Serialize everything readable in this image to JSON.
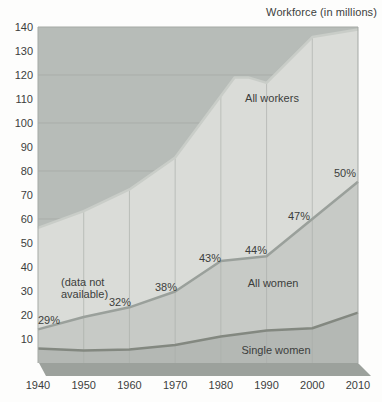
{
  "chart_data": {
    "type": "area",
    "title": "Workforce (in millions)",
    "xlabel": "",
    "ylabel": "",
    "xlim": [
      1940,
      2010
    ],
    "ylim": [
      0,
      140
    ],
    "yticks": [
      10,
      20,
      30,
      40,
      50,
      60,
      70,
      80,
      90,
      100,
      110,
      120,
      130,
      140
    ],
    "xticks": [
      1940,
      1950,
      1960,
      1970,
      1980,
      1990,
      2000,
      2010
    ],
    "ygrid_lines": [
      20,
      40,
      60,
      80,
      100,
      120
    ],
    "vgrid_years": [
      1950,
      1960,
      1970,
      1980,
      1990,
      2000
    ],
    "series": [
      {
        "name": "All workers",
        "points": [
          [
            1940,
            56.3
          ],
          [
            1950,
            63.3
          ],
          [
            1960,
            72.3
          ],
          [
            1970,
            85.6
          ],
          [
            1983,
            119
          ],
          [
            1986,
            119
          ],
          [
            1990,
            116.7
          ],
          [
            2000,
            135.8
          ],
          [
            2010,
            139
          ]
        ],
        "area_color": "#dadcd8",
        "line_color": "#c9cdc8"
      },
      {
        "name": "All women",
        "points": [
          [
            1940,
            14
          ],
          [
            1950,
            19.2
          ],
          [
            1960,
            23.2
          ],
          [
            1970,
            29.8
          ],
          [
            1980,
            42.5
          ],
          [
            1990,
            44.5
          ],
          [
            2000,
            60
          ],
          [
            2010,
            75.5
          ]
        ],
        "area_color": "#c7cac6",
        "line_color": "#9aa09b"
      },
      {
        "name": "Single women",
        "points": [
          [
            1940,
            6
          ],
          [
            1950,
            5.2
          ],
          [
            1960,
            5.6
          ],
          [
            1970,
            7.5
          ],
          [
            1980,
            11
          ],
          [
            1990,
            13.5
          ],
          [
            2000,
            14.5
          ],
          [
            2010,
            21
          ]
        ],
        "area_color": "#b4b8b4",
        "line_color": "#838880"
      }
    ],
    "series_labels": [
      {
        "text": "All workers",
        "px": [
          272,
          102
        ]
      },
      {
        "text": "All women",
        "px": [
          273,
          287
        ]
      },
      {
        "text": "Single women",
        "px": [
          276,
          354
        ]
      }
    ],
    "percent_labels": [
      {
        "year": 1940,
        "text": "29%",
        "px": [
          49,
          324
        ]
      },
      {
        "year": 1960,
        "text": "32%",
        "px": [
          120,
          306
        ]
      },
      {
        "year": 1970,
        "text": "38%",
        "px": [
          166,
          291
        ]
      },
      {
        "year": 1980,
        "text": "43%",
        "px": [
          210,
          262
        ]
      },
      {
        "year": 1990,
        "text": "44%",
        "px": [
          256,
          254
        ]
      },
      {
        "year": 2000,
        "text": "47%",
        "px": [
          299,
          220
        ]
      },
      {
        "year": 2010,
        "text": "50%",
        "px": [
          345,
          177
        ]
      }
    ],
    "note": {
      "lines": [
        "(data not",
        "available)"
      ],
      "px": [
        61,
        286
      ],
      "line_height": 12
    },
    "colors": {
      "background": "#fdfdfc",
      "plot_top_area": "#b7bcb8",
      "floor": "#9ca19c",
      "grid": "#a9ada9",
      "border": "#a5a9a5",
      "text": "#3c3e3c"
    }
  }
}
